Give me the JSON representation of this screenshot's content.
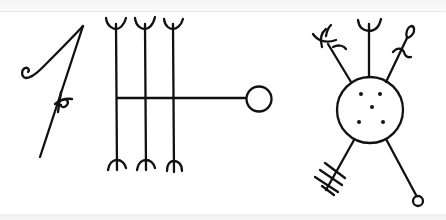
{
  "image": {
    "description": "Hand-drawn ink line drawing of three magical stave symbols on white paper",
    "colors": {
      "ink": "#111111",
      "paper": "#ffffff"
    }
  },
  "symbols": [
    {
      "name": "left-stave",
      "parts": [
        "diagonal-stroke",
        "curl-hook",
        "p-crossbar-mark"
      ]
    },
    {
      "name": "middle-stave",
      "parts": [
        "three-vertical-staves",
        "trident-tops",
        "inverted-arc-bottoms",
        "horizontal-bar",
        "end-circle"
      ],
      "stave_count": 3
    },
    {
      "name": "right-stave",
      "parts": [
        "central-circle",
        "five-dots",
        "upper-left-forked-arm",
        "upper-center-trident-arm",
        "upper-right-looped-arm",
        "lower-left-hatched-arm",
        "lower-right-ring-arm"
      ],
      "dot_count": 5
    }
  ]
}
